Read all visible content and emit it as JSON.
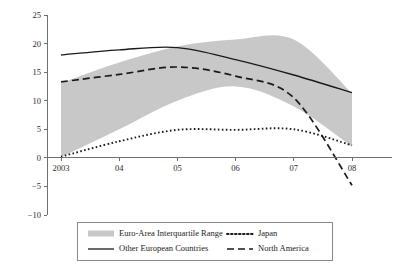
{
  "chart_data": {
    "type": "line",
    "title": "",
    "subtitle": "",
    "xlabel": "",
    "ylabel": "",
    "x": [
      2003,
      2004,
      2005,
      2006,
      2007,
      2008
    ],
    "x_tick_labels": [
      "2003",
      "04",
      "05",
      "06",
      "07",
      "08"
    ],
    "xlim": [
      2003,
      2008
    ],
    "ylim": [
      -10,
      25
    ],
    "y_ticks": [
      25,
      20,
      15,
      10,
      5,
      0,
      -5,
      -10
    ],
    "y_tick_labels": [
      "25",
      "20",
      "15",
      "10",
      "5",
      "0",
      "−5",
      "−10"
    ],
    "grid": false,
    "zero_line": true,
    "legend_position": "bottom",
    "series": [
      {
        "name": "Euro-Area Interquartile Range",
        "style": "band",
        "color": "#c8c8c8",
        "upper": [
          13.1,
          16.7,
          19.5,
          20.7,
          20.7,
          11.3
        ],
        "lower": [
          0.1,
          5.0,
          10.0,
          12.5,
          9.0,
          2.0
        ]
      },
      {
        "name": "Other European Countries",
        "style": "solid",
        "color": "#1a1a1a",
        "values": [
          18.0,
          18.9,
          19.3,
          17.2,
          14.5,
          11.4
        ]
      },
      {
        "name": "North America",
        "style": "dashed",
        "color": "#1a1a1a",
        "values": [
          13.3,
          14.6,
          15.9,
          14.3,
          10.5,
          -4.8
        ]
      },
      {
        "name": "Japan",
        "style": "dotted",
        "color": "#1a1a1a",
        "values": [
          0.2,
          2.9,
          4.9,
          4.9,
          5.0,
          2.2
        ]
      }
    ],
    "legend_entries": [
      {
        "label": "Euro-Area Interquartile Range",
        "style": "band",
        "color": "#c8c8c8"
      },
      {
        "label": "Japan",
        "style": "dotted",
        "color": "#1a1a1a"
      },
      {
        "label": "Other European Countries",
        "style": "solid",
        "color": "#1a1a1a"
      },
      {
        "label": "North America",
        "style": "dashed",
        "color": "#1a1a1a"
      }
    ]
  }
}
